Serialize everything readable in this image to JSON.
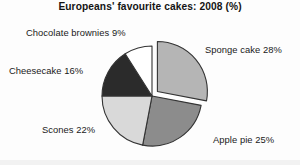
{
  "chart_data": {
    "type": "pie",
    "title": "Europeans' favourite cakes: 2008 (%)",
    "xlabel": "",
    "ylabel": "",
    "legend": "none",
    "grid": false,
    "units": "%",
    "start_angle_deg": 0,
    "direction": "clockwise",
    "categories": [
      "Sponge cake",
      "Apple pie",
      "Scones",
      "Cheesecake",
      "Chocolate brownies"
    ],
    "values": [
      28,
      25,
      22,
      16,
      9
    ],
    "total": 100,
    "slices": [
      {
        "label": "Sponge cake",
        "value": 28,
        "label_text": "Sponge cake 28%",
        "color": "#b5b5b5",
        "exploded": true
      },
      {
        "label": "Apple pie",
        "value": 25,
        "label_text": "Apple pie 25%",
        "color": "#8c8c8c",
        "exploded": false
      },
      {
        "label": "Scones",
        "value": 22,
        "label_text": "Scones 22%",
        "color": "#d9d9d9",
        "exploded": false
      },
      {
        "label": "Cheesecake",
        "value": 16,
        "label_text": "Cheesecake 16%",
        "color": "#2b2b2b",
        "exploded": false
      },
      {
        "label": "Chocolate brownies",
        "value": 9,
        "label_text": "Chocolate brownies 9%",
        "color": "#ffffff",
        "exploded": false
      }
    ]
  },
  "geometry": {
    "cx": 152,
    "cy": 96,
    "radius": 50,
    "explode_offset": 7,
    "outline_color": "#333333",
    "outline_width": 1.1
  }
}
